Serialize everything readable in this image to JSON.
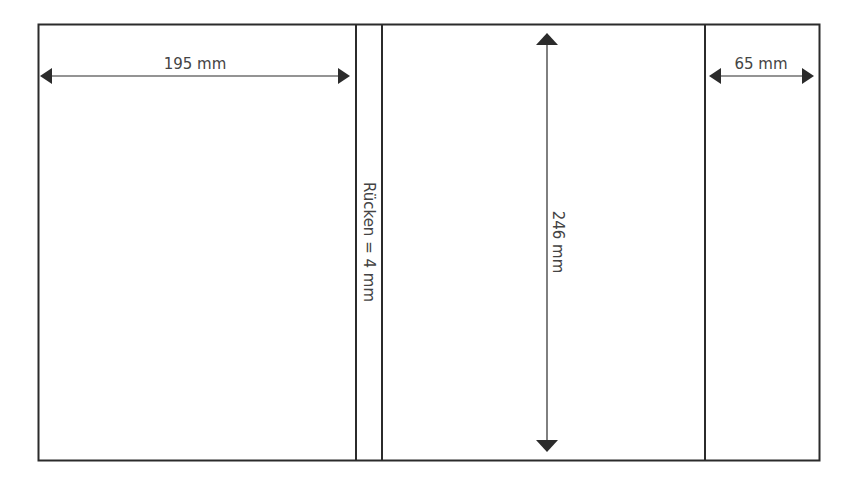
{
  "diagram": {
    "type": "book-cover-layout",
    "panels": [
      {
        "name": "back-cover",
        "width_label": "195 mm"
      },
      {
        "name": "spine",
        "label": "Rücken = 4 mm"
      },
      {
        "name": "front-cover",
        "height_label": "246 mm"
      },
      {
        "name": "flap",
        "width_label": "65 mm"
      }
    ],
    "colors": {
      "line": "#2b2b2b",
      "text": "#444444",
      "background": "#ffffff"
    }
  }
}
